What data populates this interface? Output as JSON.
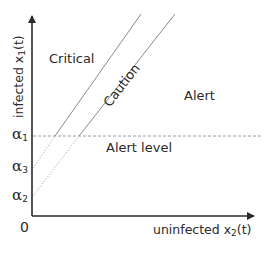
{
  "diagram": {
    "y_axis": {
      "label_main": "infected x",
      "label_sub": "1",
      "label_tail": "(t)"
    },
    "x_axis": {
      "label_main": "uninfected x",
      "label_sub": "2",
      "label_tail": "(t)"
    },
    "origin_label": "0",
    "ticks": [
      {
        "symbol": "α",
        "sub": "1"
      },
      {
        "symbol": "α",
        "sub": "3"
      },
      {
        "symbol": "α",
        "sub": "2"
      }
    ],
    "regions": {
      "critical": "Critical",
      "caution": "Caution",
      "alert": "Alert",
      "alert_level": "Alert level"
    },
    "colors": {
      "axis": "#2a2a2a",
      "boundary_line": "#8a8a8a",
      "dashed_line": "#9a9a9a",
      "text": "#2a2a2a",
      "background": "#ffffff"
    }
  }
}
